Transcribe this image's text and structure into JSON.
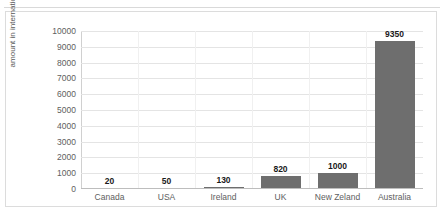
{
  "top_strip": {
    "ghost_text": "",
    "note": "faint clipped content above chart"
  },
  "chart_data": {
    "type": "bar",
    "title": "",
    "xlabel": "",
    "ylabel": "amount in international dollars",
    "categories": [
      "Canada",
      "USA",
      "Ireland",
      "UK",
      "New Zeland",
      "Australia"
    ],
    "values": [
      20,
      50,
      130,
      820,
      1000,
      9350
    ],
    "data_labels": [
      "20",
      "50",
      "130",
      "820",
      "1000",
      "9350"
    ],
    "ylim": [
      0,
      10000
    ],
    "ytick_labels": [
      "10000",
      "9000",
      "8000",
      "7000",
      "6000",
      "5000",
      "4000",
      "3000",
      "2000",
      "1000",
      "0"
    ],
    "ytick_values": [
      10000,
      9000,
      8000,
      7000,
      6000,
      5000,
      4000,
      3000,
      2000,
      1000,
      0
    ],
    "grid": true,
    "legend": false,
    "series_color": "#6e6e6e",
    "gridline_color": "#e4e4e4",
    "axis_color": "#bdbdbd",
    "tick_text_color": "#606060",
    "label_text_color": "#1a1a1a",
    "background": "#ffffff",
    "frame_color": "#dcdcdc"
  }
}
